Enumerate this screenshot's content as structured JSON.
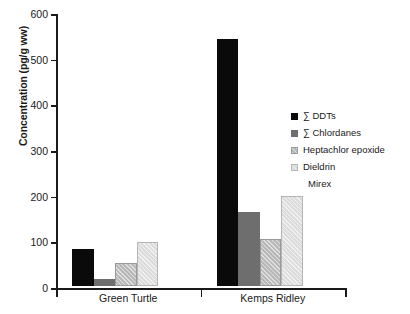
{
  "chart_data": {
    "type": "bar",
    "title": "",
    "subtitle": "",
    "xlabel": "",
    "ylabel": "Concentration (pg/g ww)",
    "categories": [
      "Green Turtle",
      "Kemps Ridley"
    ],
    "ylim": [
      0,
      600
    ],
    "yticks": [
      0,
      100,
      200,
      300,
      400,
      500,
      600
    ],
    "ytick_labels": [
      "0",
      "100",
      "200",
      "300",
      "400",
      "500",
      "600"
    ],
    "grid": false,
    "legend_position": "right",
    "series": [
      {
        "name": "∑ DDTs",
        "values": [
          80,
          540
        ],
        "color": "#0a0a0a",
        "swatch": "solid-black"
      },
      {
        "name": "∑ Chlordanes",
        "values": [
          15,
          162
        ],
        "color": "#6e6e6e",
        "swatch": "solid-dark-gray"
      },
      {
        "name": "Heptachlor epoxide",
        "values": [
          50,
          103
        ],
        "color": "#b9b9b9",
        "swatch": "hatched-mid-gray"
      },
      {
        "name": "Dieldrin",
        "values": [
          96,
          198
        ],
        "color": "#dcdcdc",
        "swatch": "hatched-light-gray"
      },
      {
        "name": "Mirex",
        "values": [
          0,
          0
        ],
        "color": "#ffffff",
        "swatch": "none"
      }
    ]
  }
}
